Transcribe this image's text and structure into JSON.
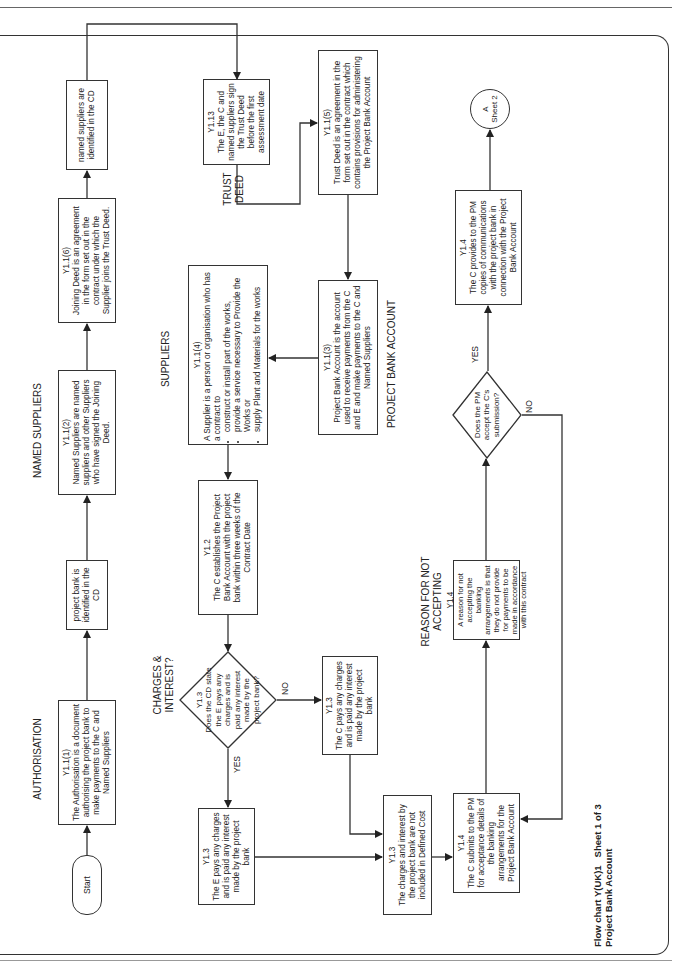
{
  "page": {
    "title_line1": "Flow chart Y(UK)1   Sheet 1 of 3",
    "title_line2": "Project Bank Account"
  },
  "section_labels": {
    "authorisation": "AUTHORISATION",
    "named_suppliers": "NAMED SUPPLIERS",
    "trust_deed": "TRUST DEED",
    "suppliers": "SUPPLIERS",
    "project_bank_account": "PROJECT BANK ACCOUNT",
    "charges_interest": "CHARGES & INTEREST?",
    "reason_not_accepting": "REASON FOR NOT ACCEPTING"
  },
  "nodes": {
    "start": {
      "label": "Start"
    },
    "authorisation": {
      "ref": "Y1.1(1)",
      "text": "The Authorisation is a document authorising the project bank to make payments to the C and Named Suppliers"
    },
    "project_bank_cd": {
      "text": "project bank is identified in the CD"
    },
    "named_suppliers": {
      "ref": "Y1.1(2)",
      "text": "Named Suppliers are named suppliers and other Suppliers who have signed the Joining Deed."
    },
    "joining_deed": {
      "ref": "Y1.1(6)",
      "text": "Joining Deed is an agreement in the form set out in the contract under which the Supplier joins the Trust Deed."
    },
    "named_suppliers_cd": {
      "text": "named suppliers are identified in the CD"
    },
    "trust_deed_sign": {
      "ref": "Y1.13",
      "text": "The E, the C and named suppliers sign the Trust Deed before the first assessment date"
    },
    "trust_deed_def": {
      "ref": "Y1.1(5)",
      "text": "Trust Deed is an agreement in the form set out in the contract which contains provisions for administering the Project Bank Account"
    },
    "project_bank_account": {
      "ref": "Y1.1(3)",
      "text": "Project Bank Account is the account used to receive payments from the C and E and make payments to the C and Named Suppliers"
    },
    "supplier_def": {
      "ref": "Y1.1(4)",
      "intro": "A Supplier is a person or organisation who has a contract to",
      "bullets": [
        "construct or install part of the works,",
        "provide a service necessary to Provide the Works or",
        "supply Plant and Materials for the works"
      ]
    },
    "establish_account": {
      "ref": "Y1.2",
      "text": "The C establishes the Project Bank Account with the project bank within three weeks of the Contract Date"
    },
    "charges_decision": {
      "ref": "Y1.3",
      "text": "Does the CD state the E pays any charges and is paid any interest made by the project bank?"
    },
    "e_pays": {
      "ref": "Y1.3",
      "text": "The E pays any charges and is paid any interest made by the project bank"
    },
    "c_pays": {
      "ref": "Y1.3",
      "text": "The C pays any charges and is paid any interest made by the project bank"
    },
    "not_defined_cost": {
      "ref": "Y1.3",
      "text": "The charges and interest by the project bank are not included in Defined Cost"
    },
    "c_submits": {
      "ref": "Y1.4",
      "text": "The C submits to the PM for acceptance details of the banking arrangements for the Project Bank Account"
    },
    "reason": {
      "ref": "Y1.4",
      "text": "A reason for not accepting the banking arrangements is that they do not provide for payments to be made in accordance with this contract"
    },
    "pm_decision": {
      "text": "Does the PM accept the C's submission?"
    },
    "c_provides": {
      "ref": "Y1.4",
      "text": "The C provides to the PM copies of communications with the project bank in connection with the Project Bank Account"
    },
    "connector_a": {
      "letter": "A",
      "label": "Sheet 2"
    }
  },
  "edge_labels": {
    "charges_yes": "YES",
    "charges_no": "NO",
    "pm_yes": "YES",
    "pm_no": "NO"
  }
}
